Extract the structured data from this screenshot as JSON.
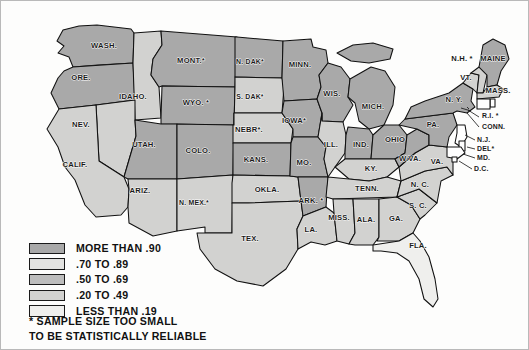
{
  "map": {
    "title": "United States choropleth map",
    "background_color": "#fdfdfc",
    "border_color": "#b9b9b9",
    "water_color": "#ffffff",
    "outline_color": "#111111",
    "shade_colors": {
      "b1": "#a9a9a9",
      "b2": "#e3e3e1",
      "b3": "#bdbdbd",
      "b4": "#d2d2d0",
      "b5": "#efefed"
    },
    "states": [
      {
        "code": "WA",
        "label": "WASH.",
        "bucket": "b1",
        "lx": 103,
        "ly": 47
      },
      {
        "code": "OR",
        "label": "ORE.",
        "bucket": "b1",
        "lx": 80,
        "ly": 79
      },
      {
        "code": "ID",
        "label": "IDAHO.",
        "bucket": "b4",
        "lx": 132,
        "ly": 98
      },
      {
        "code": "MT",
        "label": "MONT.*",
        "bucket": "b1",
        "lx": 190,
        "ly": 62
      },
      {
        "code": "WY",
        "label": "WYO. *",
        "bucket": "b1",
        "lx": 195,
        "ly": 104
      },
      {
        "code": "ND",
        "label": "N. DAK*",
        "bucket": "b1",
        "lx": 249,
        "ly": 63
      },
      {
        "code": "SD",
        "label": "S. DAK*",
        "bucket": "b4",
        "lx": 249,
        "ly": 98
      },
      {
        "code": "NE",
        "label": "NEBR*.",
        "bucket": "b4",
        "lx": 248,
        "ly": 131
      },
      {
        "code": "MN",
        "label": "MINN.",
        "bucket": "b1",
        "lx": 299,
        "ly": 66
      },
      {
        "code": "WI",
        "label": "WIS.",
        "bucket": "b1",
        "lx": 331,
        "ly": 95
      },
      {
        "code": "IA",
        "label": "IOWA*",
        "bucket": "b1",
        "lx": 293,
        "ly": 122
      },
      {
        "code": "IL",
        "label": "ILL.",
        "bucket": "b4",
        "lx": 330,
        "ly": 146
      },
      {
        "code": "MI",
        "label": "MICH.",
        "bucket": "b1",
        "lx": 372,
        "ly": 108
      },
      {
        "code": "IN",
        "label": "IND.",
        "bucket": "b1",
        "lx": 360,
        "ly": 146
      },
      {
        "code": "OH",
        "label": "OHIO",
        "bucket": "b1",
        "lx": 394,
        "ly": 141
      },
      {
        "code": "PA",
        "label": "PA.",
        "bucket": "b1",
        "lx": 432,
        "ly": 126
      },
      {
        "code": "NY",
        "label": "N. Y.",
        "bucket": "b1",
        "lx": 453,
        "ly": 101
      },
      {
        "code": "NV",
        "label": "NEV.",
        "bucket": "b4",
        "lx": 80,
        "ly": 126
      },
      {
        "code": "UT",
        "label": "UTAH.",
        "bucket": "b1",
        "lx": 143,
        "ly": 146
      },
      {
        "code": "CO",
        "label": "COLO.",
        "bucket": "b1",
        "lx": 197,
        "ly": 152
      },
      {
        "code": "CA",
        "label": "CALIF.",
        "bucket": "b4",
        "lx": 74,
        "ly": 166
      },
      {
        "code": "AZ",
        "label": "ARIZ.",
        "bucket": "b4",
        "lx": 139,
        "ly": 192
      },
      {
        "code": "NM",
        "label": "N. MEX.*",
        "bucket": "b4",
        "lx": 193,
        "ly": 204
      },
      {
        "code": "KS",
        "label": "KANS.",
        "bucket": "b1",
        "lx": 255,
        "ly": 161
      },
      {
        "code": "MO",
        "label": "MO.",
        "bucket": "b1",
        "lx": 303,
        "ly": 164
      },
      {
        "code": "OK",
        "label": "OKLA.",
        "bucket": "b4",
        "lx": 266,
        "ly": 191
      },
      {
        "code": "AR",
        "label": "ARK. *",
        "bucket": "b1",
        "lx": 310,
        "ly": 202
      },
      {
        "code": "TX",
        "label": "TEX.",
        "bucket": "b4",
        "lx": 249,
        "ly": 240
      },
      {
        "code": "LA",
        "label": "LA.",
        "bucket": "b4",
        "lx": 310,
        "ly": 231
      },
      {
        "code": "MS",
        "label": "MISS.",
        "bucket": "b4",
        "lx": 338,
        "ly": 219
      },
      {
        "code": "AL",
        "label": "ALA.",
        "bucket": "b4",
        "lx": 365,
        "ly": 221
      },
      {
        "code": "GA",
        "label": "GA.",
        "bucket": "b4",
        "lx": 395,
        "ly": 220
      },
      {
        "code": "FL",
        "label": "FLA.",
        "bucket": "b5",
        "lx": 417,
        "ly": 247
      },
      {
        "code": "TN",
        "label": "TENN.",
        "bucket": "b4",
        "lx": 366,
        "ly": 190
      },
      {
        "code": "KY",
        "label": "KY.",
        "bucket": "b4",
        "lx": 370,
        "ly": 170
      },
      {
        "code": "WV",
        "label": "W.VA.",
        "bucket": "b1",
        "lx": 409,
        "ly": 160
      },
      {
        "code": "VA",
        "label": "VA.",
        "bucket": "b4",
        "lx": 436,
        "ly": 163
      },
      {
        "code": "NC",
        "label": "N. C.",
        "bucket": "b4",
        "lx": 419,
        "ly": 186
      },
      {
        "code": "SC",
        "label": "S. C.",
        "bucket": "b4",
        "lx": 417,
        "ly": 207
      },
      {
        "code": "ME",
        "label": "MAINE",
        "bucket": "b1",
        "lx": 492,
        "ly": 60
      },
      {
        "code": "NH",
        "label": "N.H. *",
        "bucket": "b4",
        "lx": 461,
        "ly": 60
      },
      {
        "code": "VT",
        "label": "VT.",
        "bucket": "b4",
        "lx": 465,
        "ly": 79
      },
      {
        "code": "MA",
        "label": "MASS.",
        "bucket": "b4",
        "lx": 497,
        "ly": 92
      }
    ],
    "callouts": [
      {
        "code": "RI",
        "label": "R.I. *",
        "tx": 481,
        "ty": 117
      },
      {
        "code": "CT",
        "label": "CONN.",
        "tx": 481,
        "ty": 128
      },
      {
        "code": "NJ",
        "label": "N.J.",
        "tx": 476,
        "ty": 141
      },
      {
        "code": "DE",
        "label": "DEL*",
        "tx": 476,
        "ty": 150
      },
      {
        "code": "MD",
        "label": "MD.",
        "tx": 476,
        "ty": 159
      },
      {
        "code": "DC",
        "label": "D.C.",
        "tx": 473,
        "ty": 170
      }
    ]
  },
  "legend": {
    "items": [
      {
        "label": "MORE THAN .90",
        "bucket": "b1",
        "color": "#a9a9a9"
      },
      {
        "label": ".70 TO .89",
        "bucket": "b2",
        "color": "#e3e3e1"
      },
      {
        "label": ".50 TO .69",
        "bucket": "b3",
        "color": "#bdbdbd"
      },
      {
        "label": ".20 TO .49",
        "bucket": "b4",
        "color": "#d2d2d0"
      },
      {
        "label": "LESS THAN .19",
        "bucket": "b5",
        "color": "#efefed"
      }
    ]
  },
  "footnote": {
    "line1": "* SAMPLE SIZE TOO SMALL",
    "line2": "TO BE STATISTICALLY RELIABLE"
  }
}
